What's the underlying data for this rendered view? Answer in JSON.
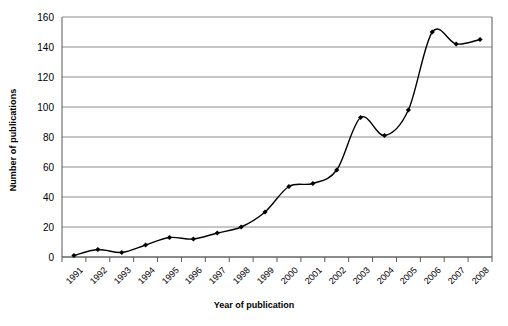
{
  "chart_data": {
    "type": "line",
    "title": "",
    "xlabel": "Year of publication",
    "ylabel": "Number of publications",
    "categories": [
      "1991",
      "1992",
      "1993",
      "1994",
      "1995",
      "1996",
      "1997",
      "1998",
      "1999",
      "2000",
      "2001",
      "2002",
      "2003",
      "2004",
      "2005",
      "2006",
      "2007",
      "2008"
    ],
    "values": [
      1,
      5,
      3,
      8,
      13,
      12,
      16,
      20,
      30,
      47,
      49,
      58,
      93,
      81,
      98,
      150,
      142,
      145
    ],
    "series": [
      {
        "name": "Number of publications",
        "values": [
          1,
          5,
          3,
          8,
          13,
          12,
          16,
          20,
          30,
          47,
          49,
          58,
          93,
          81,
          98,
          150,
          142,
          145
        ]
      }
    ],
    "ylim": [
      0,
      160
    ],
    "yticks": [
      0,
      20,
      40,
      60,
      80,
      100,
      120,
      140,
      160
    ],
    "ytick_labels": [
      "0",
      "20",
      "40",
      "60",
      "80",
      "100",
      "120",
      "140",
      "160"
    ],
    "grid": "horizontal",
    "legend": "none",
    "smoothing": "spline",
    "marker": "diamond",
    "line_color": "#000000",
    "marker_color": "#000000",
    "grid_color": "#808080",
    "axis_color": "#595959",
    "background": "#ffffff"
  }
}
